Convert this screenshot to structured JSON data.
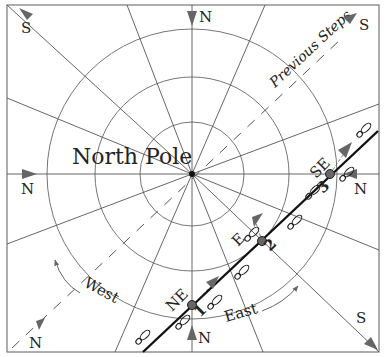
{
  "diagram": {
    "title_label": "North Pole",
    "previous_steps_label": "Previous Steps",
    "west_label": "West",
    "east_label": "East",
    "colors": {
      "line": "#555555",
      "path": "#111111",
      "arrow": "#666666",
      "point": "#666666",
      "frame": "#777777"
    },
    "edge_labels": {
      "top_left": "S",
      "top": "N",
      "top_right": "S",
      "left": "N",
      "right": "N",
      "bottom_left": "N",
      "bottom": "N",
      "bottom_right": "S"
    },
    "path_points": [
      {
        "number": "1",
        "direction": "NE"
      },
      {
        "number": "2",
        "direction": "E"
      },
      {
        "number": "3",
        "direction": "SE"
      }
    ],
    "concentric_circles": 3,
    "meridian_count": 14
  }
}
